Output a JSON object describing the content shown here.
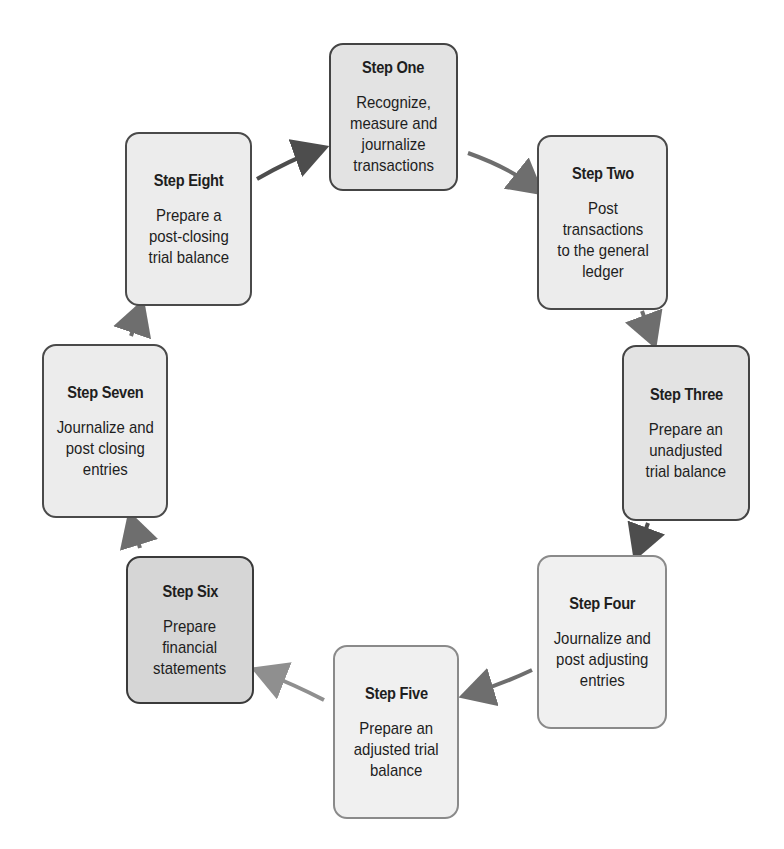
{
  "diagram": {
    "type": "cycle",
    "title": "",
    "steps": [
      {
        "title": "Step One",
        "description": "Recognize,\nmeasure and\njournalize\ntransactions"
      },
      {
        "title": "Step Two",
        "description": "Post\ntransactions\nto the general\nledger"
      },
      {
        "title": "Step Three",
        "description": "Prepare an\nunadjusted\ntrial balance"
      },
      {
        "title": "Step Four",
        "description": "Journalize and\npost adjusting\nentries"
      },
      {
        "title": "Step Five",
        "description": "Prepare an\nadjusted trial\nbalance"
      },
      {
        "title": "Step Six",
        "description": "Prepare\nfinancial\nstatements"
      },
      {
        "title": "Step Seven",
        "description": "Journalize and\npost closing\nentries"
      },
      {
        "title": "Step Eight",
        "description": "Prepare a\npost-closing\ntrial balance"
      }
    ],
    "flow": [
      {
        "from": "Step One",
        "to": "Step Two"
      },
      {
        "from": "Step Two",
        "to": "Step Three"
      },
      {
        "from": "Step Three",
        "to": "Step Four"
      },
      {
        "from": "Step Four",
        "to": "Step Five"
      },
      {
        "from": "Step Five",
        "to": "Step Six"
      },
      {
        "from": "Step Six",
        "to": "Step Seven"
      },
      {
        "from": "Step Seven",
        "to": "Step Eight"
      },
      {
        "from": "Step Eight",
        "to": "Step One"
      }
    ],
    "colors": {
      "box_fill_light": "#f0f0f0",
      "box_fill": "#ececec",
      "box_fill_dark": "#d6d6d6",
      "border": "#4a4a4a",
      "arrow_dark": "#4d4d4d",
      "arrow_mid": "#6e6e6e",
      "arrow_light": "#8f8f8f"
    }
  }
}
